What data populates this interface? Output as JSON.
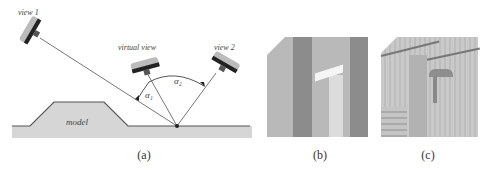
{
  "panel_a": {
    "caption": "(a)",
    "labels": {
      "view1": "view 1",
      "virtual_view": "virtual view",
      "view2": "view 2",
      "model": "model",
      "alpha1": "α₁",
      "alpha2": "α₂"
    }
  },
  "panel_b": {
    "caption": "(b)"
  },
  "panel_c": {
    "caption": "(c)"
  },
  "colors": {
    "line": "#777777",
    "model_fill": "#d9d9d9",
    "ground_fill": "#dcdcdc",
    "camera_dark": "#222222",
    "camera_light": "#bbbbbb"
  }
}
